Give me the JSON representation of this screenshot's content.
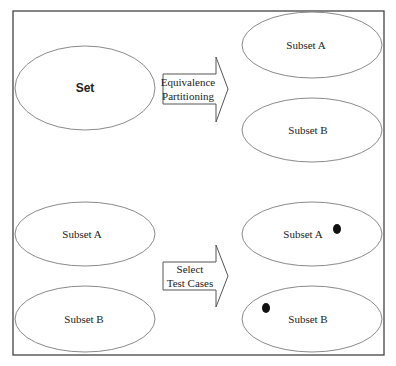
{
  "diagram": {
    "title": "",
    "frame": {
      "border_color": "#444444"
    },
    "colors": {
      "ellipse_stroke": "#8a8a8a",
      "arrow_stroke": "#555555",
      "dot": "#111111",
      "text": "#222222"
    },
    "top_section": {
      "source": {
        "label": "Set"
      },
      "arrow": {
        "line1": "Equivalence",
        "line2": "Partitioning"
      },
      "targets": [
        {
          "label": "Subset A"
        },
        {
          "label": "Subset B"
        }
      ]
    },
    "bottom_section": {
      "sources": [
        {
          "label": "Subset A"
        },
        {
          "label": "Subset B"
        }
      ],
      "arrow": {
        "line1": "Select",
        "line2": "Test Cases"
      },
      "targets": [
        {
          "label": "Subset A",
          "has_test_case_dot": true
        },
        {
          "label": "Subset B",
          "has_test_case_dot": true
        }
      ]
    }
  }
}
